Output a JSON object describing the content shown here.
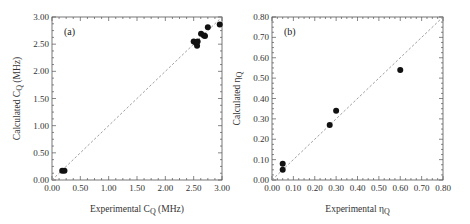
{
  "chart_data": [
    {
      "type": "scatter",
      "panel_label": "(a)",
      "title": "",
      "xlabel": "Experimental C",
      "xlabel_sub": "Q",
      "xlabel_suffix": " (MHz)",
      "ylabel": "Calculated C",
      "ylabel_sub": "Q",
      "ylabel_suffix": " (MHz)",
      "xlim": [
        0,
        3.0
      ],
      "ylim": [
        0,
        3.0
      ],
      "xticks": [
        "0.00",
        "0.50",
        "1.00",
        "1.50",
        "2.00",
        "2.50",
        "3.00"
      ],
      "yticks": [
        "0.00",
        "0.50",
        "1.00",
        "1.50",
        "2.00",
        "2.50",
        "3.00"
      ],
      "reference_line": "y = x (dashed)",
      "grid": false,
      "points": [
        {
          "x": 0.18,
          "y": 0.17
        },
        {
          "x": 0.22,
          "y": 0.17
        },
        {
          "x": 2.5,
          "y": 2.55
        },
        {
          "x": 2.54,
          "y": 2.52
        },
        {
          "x": 2.56,
          "y": 2.47
        },
        {
          "x": 2.57,
          "y": 2.55
        },
        {
          "x": 2.63,
          "y": 2.69
        },
        {
          "x": 2.68,
          "y": 2.66
        },
        {
          "x": 2.7,
          "y": 2.65
        },
        {
          "x": 2.75,
          "y": 2.81
        },
        {
          "x": 2.96,
          "y": 2.86
        }
      ]
    },
    {
      "type": "scatter",
      "panel_label": "(b)",
      "title": "",
      "xlabel": "Experimental η",
      "xlabel_sub": "Q",
      "xlabel_suffix": "",
      "ylabel": "Calculated η",
      "ylabel_sub": "Q",
      "ylabel_suffix": "",
      "xlim": [
        0,
        0.8
      ],
      "ylim": [
        0,
        0.8
      ],
      "xticks": [
        "0.00",
        "0.10",
        "0.20",
        "0.30",
        "0.40",
        "0.50",
        "0.60",
        "0.70",
        "0.80"
      ],
      "yticks": [
        "0.00",
        "0.10",
        "0.20",
        "0.30",
        "0.40",
        "0.50",
        "0.60",
        "0.70",
        "0.80"
      ],
      "reference_line": "y = x (dashed)",
      "grid": false,
      "points": [
        {
          "x": 0.05,
          "y": 0.08
        },
        {
          "x": 0.05,
          "y": 0.05
        },
        {
          "x": 0.27,
          "y": 0.27
        },
        {
          "x": 0.3,
          "y": 0.34
        },
        {
          "x": 0.6,
          "y": 0.54
        }
      ]
    }
  ]
}
